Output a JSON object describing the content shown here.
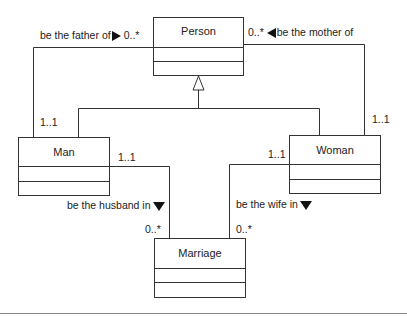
{
  "diagram": {
    "type": "UML class diagram",
    "classes": [
      {
        "id": "person",
        "name": "Person"
      },
      {
        "id": "man",
        "name": "Man"
      },
      {
        "id": "woman",
        "name": "Woman"
      },
      {
        "id": "marriage",
        "name": "Marriage"
      }
    ],
    "generalizations": [
      {
        "from": "Man",
        "to": "Person"
      },
      {
        "from": "Woman",
        "to": "Person"
      }
    ],
    "associations": {
      "father": {
        "label": "be the father of",
        "direction": "right",
        "mult_near_person": "0..*",
        "mult_near_man": "1..1"
      },
      "mother": {
        "label": "be the mother of",
        "direction": "left",
        "mult_near_person": "0..*",
        "mult_near_woman": "1..1"
      },
      "husband": {
        "label": "be the husband in",
        "direction": "down",
        "mult_near_man": "1..1",
        "mult_near_marriage": "0..*"
      },
      "wife": {
        "label": "be the wife in",
        "direction": "down",
        "mult_near_woman": "1..1",
        "mult_near_marriage": "0..*"
      }
    },
    "colors": {
      "line": "#333333",
      "background": "#ffffff",
      "arrow": "#111111"
    }
  }
}
